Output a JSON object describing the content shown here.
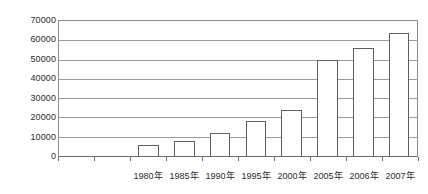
{
  "chart_data": {
    "type": "bar",
    "title": "",
    "subtitle": "",
    "xlabel": "",
    "ylabel": "",
    "categories": [
      "1980年",
      "1985年",
      "1990年",
      "1995年",
      "2000年",
      "2005年",
      "2006年",
      "2007年"
    ],
    "values": [
      5500,
      8000,
      12000,
      18000,
      24000,
      50000,
      56000,
      64000
    ],
    "ylim": [
      0,
      70000
    ],
    "y_ticks": [
      70000,
      60000,
      50000,
      40000,
      30000,
      20000,
      10000,
      0
    ],
    "y_tick_labels": [
      "70000",
      "60000",
      "50000",
      "40000",
      "30000",
      "20000",
      "10000",
      "0"
    ],
    "grid": true,
    "grid_axis": "y",
    "legend": false,
    "legend_position": "none",
    "leading_empty_slots": 2,
    "bar_fill_color": "#ffffff",
    "bar_border_color": "#5e5e5e",
    "gridline_color": "#9a9a9a",
    "axis_color": "#6e6e6e",
    "text_color": "#2b2b2b"
  }
}
